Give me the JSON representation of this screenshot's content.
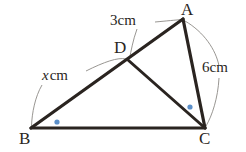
{
  "figure": {
    "type": "geometry-diagram",
    "background_color": "#ffffff",
    "stroke_color": "#2a2420",
    "leader_color": "#8d8a86",
    "marker_color": "#5b8fc9",
    "vertices": [
      {
        "id": "A",
        "label": "A",
        "x": 183,
        "y": 19
      },
      {
        "id": "B",
        "label": "B",
        "x": 31,
        "y": 128
      },
      {
        "id": "C",
        "label": "C",
        "x": 205,
        "y": 128
      },
      {
        "id": "D",
        "label": "D",
        "x": 128,
        "y": 60
      }
    ],
    "segments": [
      {
        "id": "AB",
        "from": "A",
        "to": "B",
        "style": "thick"
      },
      {
        "id": "AC",
        "from": "A",
        "to": "C",
        "style": "thick"
      },
      {
        "id": "BC",
        "from": "B",
        "to": "C",
        "style": "thick"
      },
      {
        "id": "DC",
        "from": "D",
        "to": "C",
        "style": "thick"
      }
    ],
    "measurements": [
      {
        "id": "AD",
        "text": "3 cm",
        "value": "3",
        "unit": "cm",
        "applies_to": "AD"
      },
      {
        "id": "BD",
        "text": "x cm",
        "value": "x",
        "unit": "cm",
        "applies_to": "BD",
        "italic_value": true
      },
      {
        "id": "AC",
        "text": "6 cm",
        "value": "6",
        "unit": "cm",
        "applies_to": "AC"
      }
    ],
    "angle_markers": [
      {
        "id": "angle-B",
        "at_vertex": "B",
        "x": 57,
        "y": 122,
        "shape": "dot",
        "color": "#5b8fc9"
      },
      {
        "id": "angle-DCB",
        "at_vertex": "C",
        "x": 190,
        "y": 107,
        "shape": "dot",
        "color": "#5b8fc9"
      }
    ]
  },
  "labels": {
    "A": "A",
    "B": "B",
    "C": "C",
    "D": "D",
    "len_ad": "3 cm",
    "len_ad_value": "3",
    "len_ad_unit": "cm",
    "len_bd_value": "x",
    "len_bd_unit": "cm",
    "len_ac": "6 cm",
    "len_ac_value": "6",
    "len_ac_unit": "cm"
  }
}
